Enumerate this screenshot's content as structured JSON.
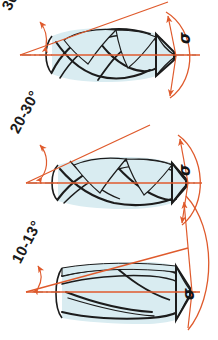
{
  "figure": {
    "colors": {
      "annotation": "#df5a2c",
      "outline": "#1c1c1c",
      "flute_fill": "#d9ecf1",
      "background": "#ffffff",
      "centerline": "#6e6e6e"
    }
  },
  "diagrams": [
    {
      "id": "drill-high-helix",
      "helix_angle_label": "30-40",
      "point_angle_label": "σ",
      "helix_description": "steep / high helix angle twist drill",
      "flutes": 3,
      "centerline": true
    },
    {
      "id": "drill-medium-helix",
      "helix_angle_label": "20-30°",
      "point_angle_label": "σ",
      "helix_description": "medium helix angle twist drill",
      "flutes": 3,
      "centerline": true
    },
    {
      "id": "drill-low-helix",
      "helix_angle_label": "10-13°",
      "point_angle_label": "σ",
      "helix_description": "shallow / low helix angle twist drill",
      "flutes": 3,
      "centerline": true
    }
  ]
}
